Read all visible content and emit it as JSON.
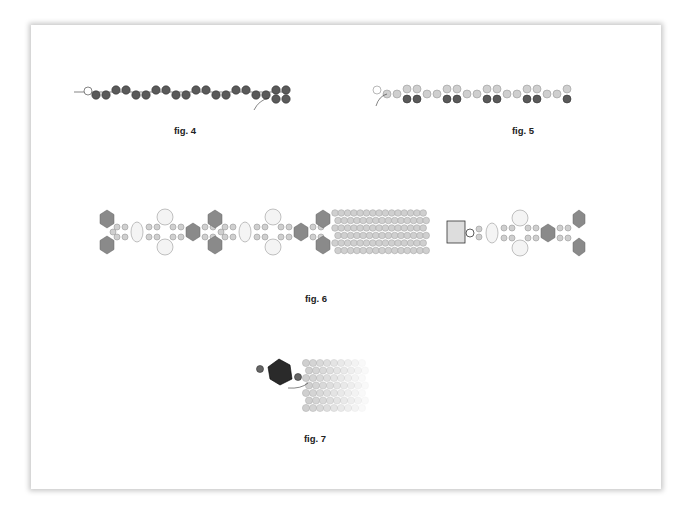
{
  "figures": [
    {
      "id": "fig4",
      "caption": "fig. 4",
      "description": "Strand of dark gray seed beads in wavy pairs with a stop bead at left and a turn-around arrow at right"
    },
    {
      "id": "fig5",
      "caption": "fig. 5",
      "description": "Row of light and dark beads forming a second row with arrow at left"
    },
    {
      "id": "fig6",
      "caption": "fig. 6",
      "description": "Bracelet pattern with bicones, ovals, round pearls and peyote band; clasp section at right"
    },
    {
      "id": "fig7",
      "caption": "fig. 7",
      "description": "Large crystal bicone attached to fading peyote band with thread path arrow"
    }
  ],
  "colors": {
    "dark_bead": "#5a5a5a",
    "light_bead": "#cfcfcf",
    "bicone": "#8a8a8a",
    "pearl": "#f4f4f4",
    "frame_shadow": "#bdbdbd"
  }
}
